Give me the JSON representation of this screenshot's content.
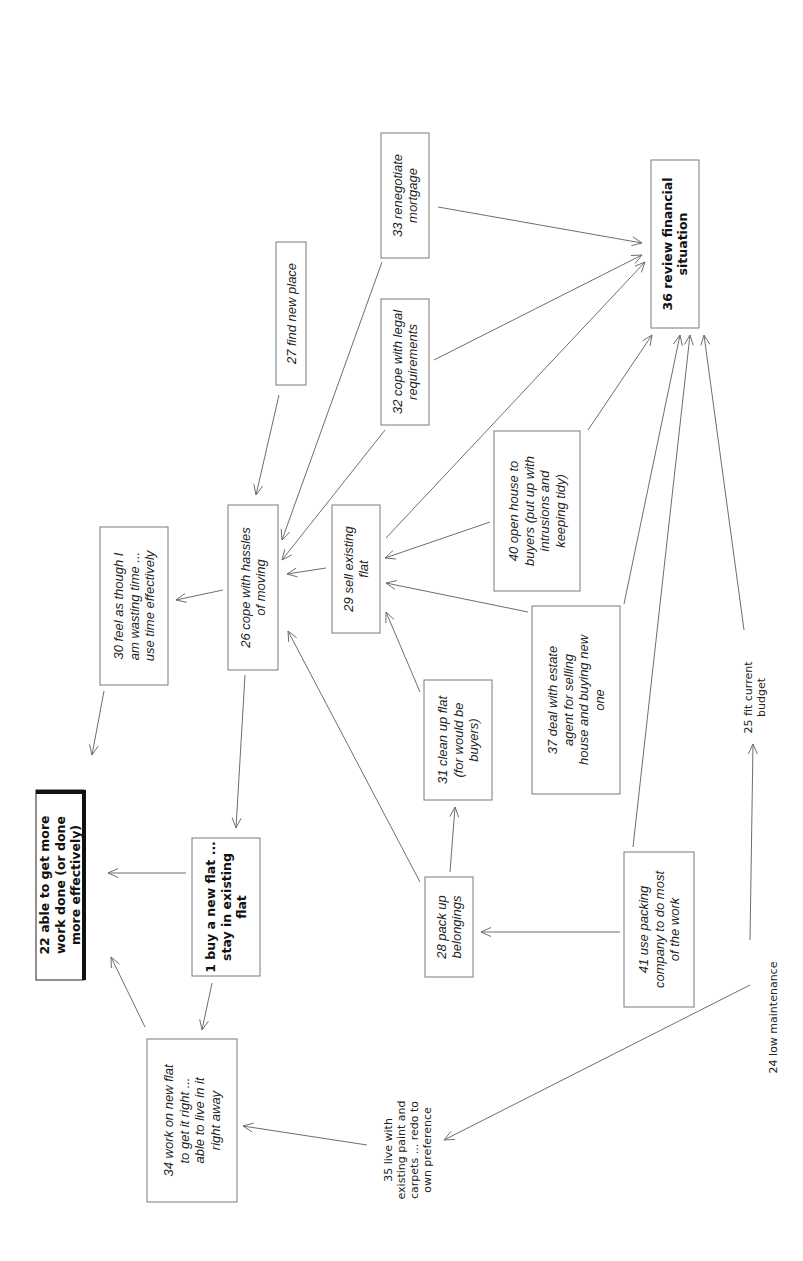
{
  "diagram": {
    "nodes": [
      {
        "id": "22",
        "lines": [
          "22 able to get more",
          "work done (or done",
          "more effectively)"
        ],
        "style": "bold-emph"
      },
      {
        "id": "1",
        "lines": [
          "1 buy a new flat ...",
          "stay in existing",
          "flat"
        ],
        "style": "bold"
      },
      {
        "id": "30",
        "lines": [
          "30 feel as though I",
          "am wasting time ...",
          "use time effectively"
        ],
        "style": "italic"
      },
      {
        "id": "26",
        "lines": [
          "26 cope with hassles",
          "of moving"
        ],
        "style": "italic"
      },
      {
        "id": "27",
        "lines": [
          "27 find new place"
        ],
        "style": "italic"
      },
      {
        "id": "33",
        "lines": [
          "33 renegotiate",
          "mortgage"
        ],
        "style": "italic"
      },
      {
        "id": "32",
        "lines": [
          "32 cope with legal",
          "requirements"
        ],
        "style": "italic"
      },
      {
        "id": "29",
        "lines": [
          "29 sell existing",
          "flat"
        ],
        "style": "italic"
      },
      {
        "id": "40",
        "lines": [
          "40 open house to",
          "buyers (put up with",
          "intrusions and",
          "keeping tidy)"
        ],
        "style": "italic"
      },
      {
        "id": "36",
        "lines": [
          "36 review financial",
          "situation"
        ],
        "style": "bold"
      },
      {
        "id": "31",
        "lines": [
          "31 clean up flat",
          "(for would be",
          "buyers)"
        ],
        "style": "italic"
      },
      {
        "id": "37",
        "lines": [
          "37 deal with estate",
          "agent for selling",
          "house and buying new",
          "one"
        ],
        "style": "italic"
      },
      {
        "id": "28",
        "lines": [
          "28 pack up",
          "belongings"
        ],
        "style": "italic"
      },
      {
        "id": "41",
        "lines": [
          "41 use packing",
          "company to do most",
          "of the work"
        ],
        "style": "italic"
      },
      {
        "id": "34",
        "lines": [
          "34 work on new flat",
          "to get it right ...",
          "able to live in it",
          "right away"
        ],
        "style": "italic"
      },
      {
        "id": "35",
        "lines": [
          "35 live with",
          "existing paint and",
          "carpets ... redo to",
          "own preference"
        ],
        "style": "plain"
      },
      {
        "id": "24",
        "lines": [
          "24 low maintenance"
        ],
        "style": "plain"
      },
      {
        "id": "25",
        "lines": [
          "25 fit current",
          "budget"
        ],
        "style": "plain"
      }
    ],
    "edges": [
      {
        "from": "1",
        "to": "22"
      },
      {
        "from": "34",
        "to": "22"
      },
      {
        "from": "30",
        "to": "22"
      },
      {
        "from": "26",
        "to": "1"
      },
      {
        "from": "1",
        "to": "34"
      },
      {
        "from": "26",
        "to": "30"
      },
      {
        "from": "27",
        "to": "26"
      },
      {
        "from": "33",
        "to": "26"
      },
      {
        "from": "32",
        "to": "26"
      },
      {
        "from": "29",
        "to": "26"
      },
      {
        "from": "28",
        "to": "26"
      },
      {
        "from": "40",
        "to": "29"
      },
      {
        "from": "31",
        "to": "29"
      },
      {
        "from": "37",
        "to": "29"
      },
      {
        "from": "28",
        "to": "31"
      },
      {
        "from": "41",
        "to": "28"
      },
      {
        "from": "33",
        "to": "36"
      },
      {
        "from": "32",
        "to": "36"
      },
      {
        "from": "29",
        "to": "36"
      },
      {
        "from": "40",
        "to": "36"
      },
      {
        "from": "37",
        "to": "36"
      },
      {
        "from": "41",
        "to": "36"
      },
      {
        "from": "25",
        "to": "36"
      },
      {
        "from": "24",
        "to": "25"
      },
      {
        "from": "24",
        "to": "35"
      },
      {
        "from": "35",
        "to": "34"
      }
    ]
  }
}
